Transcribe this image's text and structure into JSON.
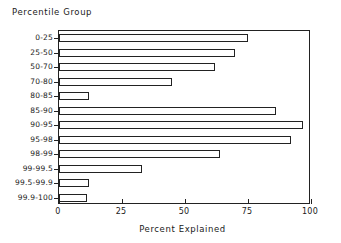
{
  "chart_data": {
    "type": "bar",
    "orientation": "horizontal",
    "title": "",
    "xlabel": "Percent Explained",
    "ylabel": "Percentile Group",
    "xlim": [
      0,
      100
    ],
    "xticks": [
      0,
      25,
      50,
      75,
      100
    ],
    "xtick_labels": [
      "0",
      "25",
      "50",
      "75",
      "100"
    ],
    "grid": false,
    "legend": null,
    "categories": [
      "0-25",
      "25-50",
      "50-70",
      "70-80",
      "80-85",
      "85-90",
      "90-95",
      "95-98",
      "98-99",
      "99-99.5",
      "99.5-99.9",
      "99.9-100"
    ],
    "values": [
      75,
      70,
      62,
      45,
      12,
      86,
      97,
      92,
      64,
      33,
      12,
      11
    ],
    "bar_style": {
      "fill": "#ffffff",
      "edge": "#222222"
    }
  }
}
